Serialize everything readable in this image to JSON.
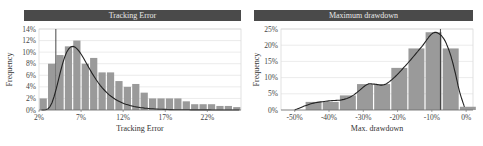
{
  "chart_data": [
    {
      "type": "bar",
      "title": "Tracking Error",
      "xlabel": "Tracking  Error",
      "ylabel": "Frequency",
      "ylim": [
        0,
        14
      ],
      "xlim": [
        2,
        26
      ],
      "yticks": [
        "0%",
        "2%",
        "4%",
        "6%",
        "8%",
        "10%",
        "12%",
        "14%"
      ],
      "xticks": [
        "2%",
        "7%",
        "12%",
        "17%",
        "22%"
      ],
      "xtick_values": [
        2,
        7,
        12,
        17,
        22
      ],
      "bin_width": 1,
      "bin_starts": [
        2,
        3,
        4,
        5,
        6,
        7,
        8,
        9,
        10,
        11,
        12,
        13,
        14,
        15,
        16,
        17,
        18,
        19,
        20,
        21,
        22,
        23,
        24,
        25
      ],
      "values": [
        2,
        8,
        9.5,
        11,
        12,
        8,
        9,
        6.5,
        6.5,
        5,
        4,
        4.5,
        3,
        2,
        2,
        2,
        2,
        1.5,
        1,
        1,
        1,
        0.7,
        0.7,
        0.5
      ],
      "fitted_curve": "lognormal density overlay peaking ~11% near 6%",
      "marker_line_x": 4,
      "grid": true,
      "colors": {
        "bar": "#9a9a9a",
        "curve": "#222222",
        "title_bg": "#4a4a4a",
        "grid": "#dddddd"
      }
    },
    {
      "type": "bar",
      "title": "Maximum drawdown",
      "xlabel": "Max. drawdown",
      "ylabel": "Frequency",
      "ylim": [
        0,
        25
      ],
      "xlim": [
        -54,
        2
      ],
      "yticks": [
        "0%",
        "5%",
        "10%",
        "15%",
        "20%",
        "25%"
      ],
      "xticks": [
        "-50%",
        "-40%",
        "-30%",
        "-20%",
        "-10%",
        "0%"
      ],
      "xtick_values": [
        -50,
        -40,
        -30,
        -20,
        -10,
        0
      ],
      "bin_width": 5,
      "bin_starts": [
        -47,
        -42,
        -37,
        -32,
        -27,
        -22,
        -17,
        -12,
        -7,
        -2
      ],
      "values": [
        2.5,
        2.5,
        4.5,
        8,
        8,
        13,
        19,
        24,
        19,
        1
      ],
      "fitted_curve": "kernel density overlay peaking ~24% near -10%",
      "marker_line_x": -7.5,
      "grid": true,
      "colors": {
        "bar": "#9a9a9a",
        "curve": "#222222",
        "title_bg": "#4a4a4a",
        "grid": "#dddddd"
      }
    }
  ]
}
